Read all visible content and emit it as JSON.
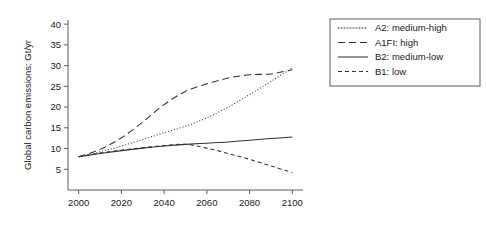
{
  "chart_data": {
    "type": "line",
    "title": "",
    "xlabel": "",
    "ylabel": "Global carbon emissions: Gt/yr",
    "xlim": [
      1995,
      2105
    ],
    "ylim": [
      0,
      41
    ],
    "grid": false,
    "legend_position": "top-right",
    "xticks": [
      2000,
      2020,
      2040,
      2060,
      2080,
      2100
    ],
    "xtick_labels": [
      "2000",
      "2020",
      "2040",
      "2060",
      "2080",
      "2100"
    ],
    "yticks": [
      5,
      10,
      15,
      20,
      25,
      30,
      35,
      40
    ],
    "ytick_labels": [
      "5",
      "10",
      "15",
      "20",
      "25",
      "30",
      "35",
      "40"
    ],
    "x": [
      2000,
      2010,
      2020,
      2030,
      2040,
      2050,
      2060,
      2070,
      2080,
      2090,
      2100
    ],
    "series": [
      {
        "name": "A2: medium-high",
        "dash": "dotted",
        "dasharray": "1,2",
        "color": "#333333",
        "values": [
          8.0,
          9.2,
          10.6,
          12.2,
          13.8,
          15.4,
          17.4,
          20.0,
          23.0,
          26.2,
          29.4
        ]
      },
      {
        "name": "A1FI: high",
        "dash": "dashed-long",
        "dasharray": "7,4",
        "color": "#333333",
        "values": [
          8.0,
          9.8,
          12.6,
          16.4,
          20.6,
          23.8,
          25.6,
          27.0,
          27.8,
          28.0,
          29.0
        ]
      },
      {
        "name": "B2: medium-low",
        "dash": "solid",
        "dasharray": "",
        "color": "#333333",
        "values": [
          8.0,
          8.8,
          9.5,
          10.1,
          10.6,
          11.0,
          11.3,
          11.6,
          12.0,
          12.4,
          12.8
        ]
      },
      {
        "name": "B1: low",
        "dash": "dashed-short",
        "dasharray": "4,3",
        "color": "#333333",
        "values": [
          8.0,
          8.9,
          9.6,
          10.2,
          10.7,
          11.0,
          10.1,
          8.8,
          7.4,
          5.8,
          4.2
        ]
      }
    ]
  },
  "legend": {
    "entries": [
      {
        "label": "A2: medium-high"
      },
      {
        "label": "A1FI: high"
      },
      {
        "label": "B2: medium-low"
      },
      {
        "label": "B1: low"
      }
    ]
  },
  "colors": {
    "axis": "#4d4d4d",
    "line": "#333333",
    "text": "#1a1a1a",
    "background": "#ffffff"
  }
}
